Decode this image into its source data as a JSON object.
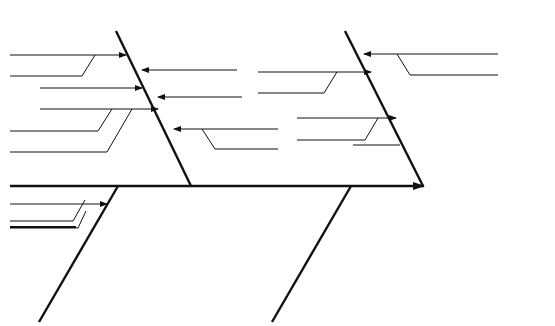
{
  "diagram": {
    "type": "cause-and-effect (fishbone)",
    "effect": {
      "lines": [
        "R chart",
        "for weld",
        "strength"
      ],
      "icon": "control-chart-icon"
    },
    "categories": {
      "process": {
        "label": "Process",
        "causes": {
          "steppers": "Steppers",
          "program": "Program",
          "voltage": "Voltage",
          "tips": "Tips",
          "deflect": "Deflect",
          "alignment": "Alignment",
          "arc_gap": "ARC GAP",
          "current": "Current",
          "pressure": "Pressure",
          "desurge": "Desurge"
        }
      },
      "man": {
        "label": "Man",
        "causes": {
          "inspector": "Inspector",
          "training_inspector": "Training",
          "welding_maintenance": "Welding maintenance",
          "training_welding": "Training",
          "feed_rate": "Feed rate",
          "too_slow": "Too slow"
        }
      },
      "material": {
        "label": "Material",
        "causes": {
          "part_variation": "Part variation",
          "surface_finish": "Surface finish",
          "voids": "Voids",
          "contamination": "Contamination",
          "coating": "Coating"
        }
      },
      "method": {
        "label": "Method",
        "causes": {
          "preventive_maintenance": "Preventive maintenance",
          "frequency_pm": "Frequency",
          "procedure_pm": "Procedure",
          "data_collection": "Data collection",
          "frequency_dc": "Frequency",
          "tabulation": "Tabulation",
          "corrective_action": "Corrective action",
          "procedure_ca": "Procedure",
          "follow_up": "Follow-up"
        }
      }
    },
    "colors": {
      "line": "#111111",
      "background": "#ffffff",
      "text": "#1a1a1a"
    }
  }
}
